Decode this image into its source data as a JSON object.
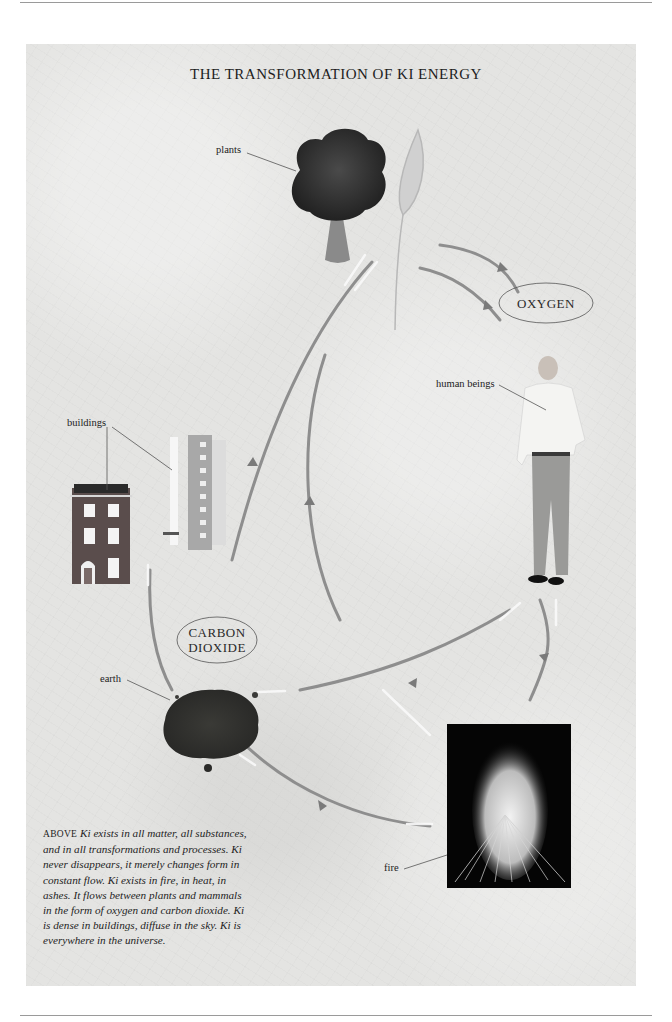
{
  "page": {
    "title": "THE TRANSFORMATION OF KI ENERGY"
  },
  "labels": {
    "plants": "plants",
    "human_beings": "human beings",
    "buildings": "buildings",
    "earth": "earth",
    "fire": "fire"
  },
  "cycle_nodes": {
    "oxygen": "OXYGEN",
    "carbon_dioxide_line1": "CARBON",
    "carbon_dioxide_line2": "DIOXIDE"
  },
  "illustrations": [
    {
      "name": "tree",
      "label": "plants"
    },
    {
      "name": "wheat-ear",
      "label": "plants"
    },
    {
      "name": "man-standing",
      "label": "human beings"
    },
    {
      "name": "brick-townhouse",
      "label": "buildings"
    },
    {
      "name": "tower-block",
      "label": "buildings"
    },
    {
      "name": "soil-pile",
      "label": "earth"
    },
    {
      "name": "bonfire",
      "label": "fire"
    }
  ],
  "caption": {
    "lead": "ABOVE",
    "text": "Ki exists in all matter, all substances, and in all transformations and processes. Ki never disappears, it merely changes form in constant flow. Ki exists in fire, in heat, in ashes. It flows between plants and mammals in the form of oxygen and carbon dioxide. Ki is dense in buildings, diffuse in the sky. Ki is everywhere in the universe."
  },
  "colors": {
    "paper": "#e4e4e2",
    "ink": "#1d1d1d",
    "arrow": "#8a8a8a",
    "brick": "#5a4a48"
  }
}
